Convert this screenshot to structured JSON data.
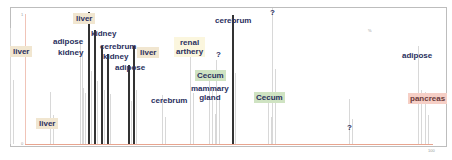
{
  "chart_data": {
    "type": "bar",
    "title": "",
    "xlabel": "",
    "ylabel": "",
    "grid": false,
    "legend": "none",
    "axis_labels": {
      "y_top": "1",
      "y_bottom": "0",
      "x_right": "100",
      "top_right_note": "%"
    },
    "peaks": [
      {
        "label": "liver",
        "x": 10,
        "height": 0.85,
        "style": "liver"
      },
      {
        "label": "liver",
        "x": 50,
        "height": 0.38,
        "style": "liver"
      },
      {
        "label": "adipose",
        "x": 80,
        "height": 0.75,
        "style": "plain"
      },
      {
        "label": "kidney",
        "x": 82,
        "height": 0.68,
        "style": "plain"
      },
      {
        "label": "liver",
        "x": 88,
        "height": 0.97,
        "style": "liver"
      },
      {
        "label": "kidney",
        "x": 94,
        "height": 0.84,
        "style": "plain"
      },
      {
        "label": "cerebrum",
        "x": 101,
        "height": 0.72,
        "style": "plain"
      },
      {
        "label": "kidney",
        "x": 107,
        "height": 0.66,
        "style": "plain"
      },
      {
        "label": "adipose",
        "x": 128,
        "height": 0.58,
        "style": "plain"
      },
      {
        "label": "liver",
        "x": 133,
        "height": 0.72,
        "style": "liver"
      },
      {
        "label": "cerebrum",
        "x": 162,
        "height": 0.36,
        "style": "plain"
      },
      {
        "label": "renal arthery",
        "x": 190,
        "height": 0.68,
        "style": "renal"
      },
      {
        "label": "?",
        "x": 216,
        "height": 0.62,
        "style": "plain"
      },
      {
        "label": "Cecum",
        "x": 209,
        "height": 0.52,
        "style": "cecum"
      },
      {
        "label": "mammary gland",
        "x": 212,
        "height": 0.4,
        "style": "plain"
      },
      {
        "label": "cerebrum",
        "x": 232,
        "height": 0.95,
        "style": "plain"
      },
      {
        "label": "?",
        "x": 272,
        "height": 1.0,
        "style": "plain"
      },
      {
        "label": "Cecum",
        "x": 268,
        "height": 0.36,
        "style": "cecum"
      },
      {
        "label": "?",
        "x": 349,
        "height": 0.33,
        "style": "plain"
      },
      {
        "label": "adipose",
        "x": 418,
        "height": 0.72,
        "style": "plain"
      },
      {
        "label": "pancreas",
        "x": 425,
        "height": 0.38,
        "style": "pancreas"
      }
    ]
  },
  "labels": [
    {
      "text": "liver",
      "x": 10,
      "y": 46,
      "style": "liver"
    },
    {
      "text": "adipose",
      "x": 53,
      "y": 37,
      "style": "plain"
    },
    {
      "text": "kidney",
      "x": 58,
      "y": 48,
      "style": "plain"
    },
    {
      "text": "liver",
      "x": 73,
      "y": 13,
      "style": "liver"
    },
    {
      "text": "kidney",
      "x": 91,
      "y": 29,
      "style": "plain"
    },
    {
      "text": "cerebrum",
      "x": 100,
      "y": 42,
      "style": "plain"
    },
    {
      "text": "kidney",
      "x": 103,
      "y": 52,
      "style": "plain"
    },
    {
      "text": "adipose",
      "x": 115,
      "y": 63,
      "style": "plain"
    },
    {
      "text": "liver",
      "x": 137,
      "y": 47,
      "style": "liver"
    },
    {
      "text": "liver",
      "x": 36,
      "y": 118,
      "style": "liver"
    },
    {
      "text": "cerebrum",
      "x": 151,
      "y": 96,
      "style": "plain"
    },
    {
      "text": "renal\narthery",
      "x": 174,
      "y": 37,
      "style": "renal"
    },
    {
      "text": "?",
      "x": 216,
      "y": 50,
      "style": "plain"
    },
    {
      "text": "Cecum",
      "x": 195,
      "y": 70,
      "style": "cecum"
    },
    {
      "text": "mammary\ngland",
      "x": 191,
      "y": 84,
      "style": "plain"
    },
    {
      "text": "cerebrum",
      "x": 215,
      "y": 16,
      "style": "plain"
    },
    {
      "text": "?",
      "x": 270,
      "y": 8,
      "style": "plain"
    },
    {
      "text": "Cecum",
      "x": 254,
      "y": 92,
      "style": "cecum"
    },
    {
      "text": "?",
      "x": 347,
      "y": 123,
      "style": "plain"
    },
    {
      "text": "adipose",
      "x": 402,
      "y": 51,
      "style": "plain"
    },
    {
      "text": "pancreas",
      "x": 408,
      "y": 93,
      "style": "pancreas"
    }
  ]
}
